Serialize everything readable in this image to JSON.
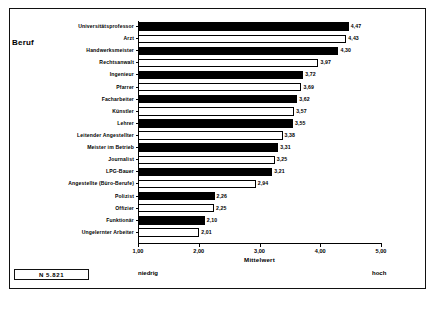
{
  "axis_title_y": "Beruf",
  "footer": {
    "n_label": "N 5.821",
    "low_label": "niedrig",
    "high_label": "hoch"
  },
  "chart_data": {
    "type": "bar",
    "orientation": "horizontal",
    "title": "",
    "xlabel": "Mittelwert",
    "ylabel": "Beruf",
    "xlim": [
      1.0,
      5.0
    ],
    "xticks": [
      1.0,
      2.0,
      3.0,
      4.0,
      5.0
    ],
    "xticklabels": [
      "1,00",
      "2,00",
      "3,00",
      "4,00",
      "5,00"
    ],
    "grid": false,
    "legend": null,
    "decimal_separator": ",",
    "annotations": [
      "niedrig",
      "hoch",
      "N 5.821"
    ],
    "categories": [
      "Universitätsprofessor",
      "Arzt",
      "Handwerksmeister",
      "Rechtsanwalt",
      "Ingenieur",
      "Pfarrer",
      "Facharbeiter",
      "Künstler",
      "Lehrer",
      "Leitender Angestellter",
      "Meister im Betrieb",
      "Journalist",
      "LPG-Bauer",
      "Angestellte (Büro-Berufe)",
      "Polizist",
      "Offizier",
      "Funktionär",
      "Ungelernter Arbeiter"
    ],
    "values": [
      4.47,
      4.43,
      4.3,
      3.97,
      3.72,
      3.69,
      3.62,
      3.57,
      3.55,
      3.38,
      3.31,
      3.25,
      3.21,
      2.94,
      2.26,
      2.25,
      2.1,
      2.01
    ],
    "value_labels": [
      "4,47",
      "4,43",
      "4,30",
      "3,97",
      "3,72",
      "3,69",
      "3,62",
      "3,57",
      "3,55",
      "3,38",
      "3,31",
      "3,25",
      "3,21",
      "2,94",
      "2,26",
      "2,25",
      "2,10",
      "2,01"
    ],
    "bar_fills": [
      "black",
      "white",
      "black",
      "white",
      "black",
      "white",
      "black",
      "white",
      "black",
      "white",
      "black",
      "white",
      "black",
      "white",
      "black",
      "white",
      "black",
      "white"
    ],
    "bar_colors": {
      "black": "#000000",
      "white": "#ffffff",
      "edge": "#000000"
    }
  }
}
